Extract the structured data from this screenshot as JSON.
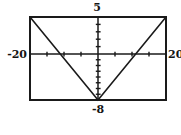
{
  "chart_data": {
    "type": "line",
    "title": "",
    "window": {
      "xmin": -20,
      "xmax": 20,
      "xscl": 5,
      "ymin": -8,
      "ymax": 5,
      "yscl": 1
    },
    "series": [
      {
        "name": "v-graph",
        "points": [
          [
            -20,
            5
          ],
          [
            0,
            -8
          ],
          [
            20,
            5
          ]
        ]
      }
    ],
    "axis_labels": {
      "top": "5",
      "left": "-20",
      "right": "20",
      "bottom": "-8"
    },
    "grid": false,
    "legend": false,
    "line_color": "#1a1a1a"
  }
}
